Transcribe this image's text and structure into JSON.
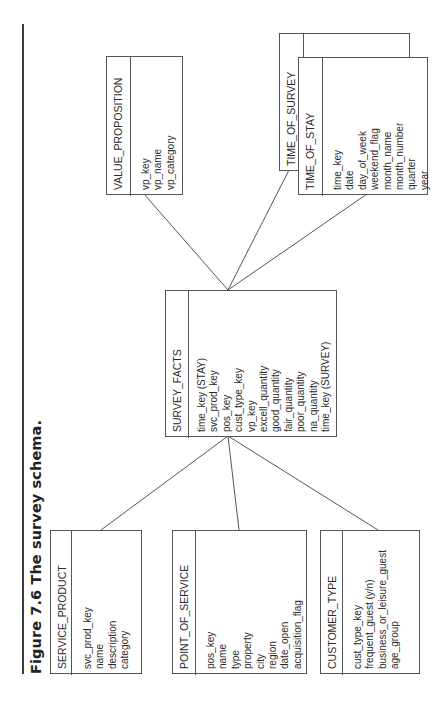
{
  "figure": {
    "caption": "Figure 7.6 The survey schema."
  },
  "entities": {
    "value_proposition": {
      "name": "VALUE_PROPOSITION",
      "fields": [
        "vp_key",
        "vp_name",
        "vp_category"
      ]
    },
    "time_of_survey": {
      "name": "TIME_OF_SURVEY",
      "fields": []
    },
    "time_of_stay": {
      "name": "TIME_OF_STAY",
      "fields": [
        "time_key",
        "date",
        "day_of_week",
        "weekend_flag",
        "month_name",
        "month_number",
        "quarter",
        "year"
      ]
    },
    "survey_facts": {
      "name": "SURVEY_FACTS",
      "fields": [
        "time_key (STAY)",
        "svc_prod_key",
        "pos_key",
        "cust_type_key",
        "vp_key",
        "excell_quantity",
        "good_quantity",
        "fair_quantity",
        "poor_quantity",
        "na_quantity",
        "time_key (SURVEY)"
      ]
    },
    "service_product": {
      "name": "SERVICE_PRODUCT",
      "fields": [
        "svc_prod_key",
        "name",
        "description",
        "category"
      ]
    },
    "point_of_service": {
      "name": "POINT_OF_SERVICE",
      "fields": [
        "pos_key",
        "name",
        "type",
        "property",
        "city",
        "region",
        "date_open",
        "acquisition_flag"
      ]
    },
    "customer_type": {
      "name": "CUSTOMER_TYPE",
      "fields": [
        "cust_type_key",
        "frequent_guest (y/n)",
        "business_or_leisure_guest",
        "age_group"
      ]
    }
  },
  "relationships": [
    {
      "from": "SURVEY_FACTS",
      "to": "VALUE_PROPOSITION"
    },
    {
      "from": "SURVEY_FACTS",
      "to": "TIME_OF_SURVEY"
    },
    {
      "from": "SURVEY_FACTS",
      "to": "TIME_OF_STAY"
    },
    {
      "from": "SURVEY_FACTS",
      "to": "SERVICE_PRODUCT"
    },
    {
      "from": "SURVEY_FACTS",
      "to": "POINT_OF_SERVICE"
    },
    {
      "from": "SURVEY_FACTS",
      "to": "CUSTOMER_TYPE"
    }
  ],
  "colors": {
    "line": "#555555",
    "text": "#2a2a2a",
    "background": "#ffffff"
  }
}
